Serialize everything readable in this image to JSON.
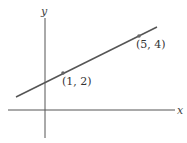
{
  "diagram": {
    "type": "coordinate-plane-line",
    "axes": {
      "x_label": "x",
      "y_label": "y"
    },
    "points": [
      {
        "label": "(1, 2)",
        "x": 1,
        "y": 2
      },
      {
        "label": "(5, 4)",
        "x": 5,
        "y": 4
      }
    ],
    "colors": {
      "line": "#555555",
      "axis": "#555555",
      "point": "#666666",
      "text": "#333333"
    }
  }
}
